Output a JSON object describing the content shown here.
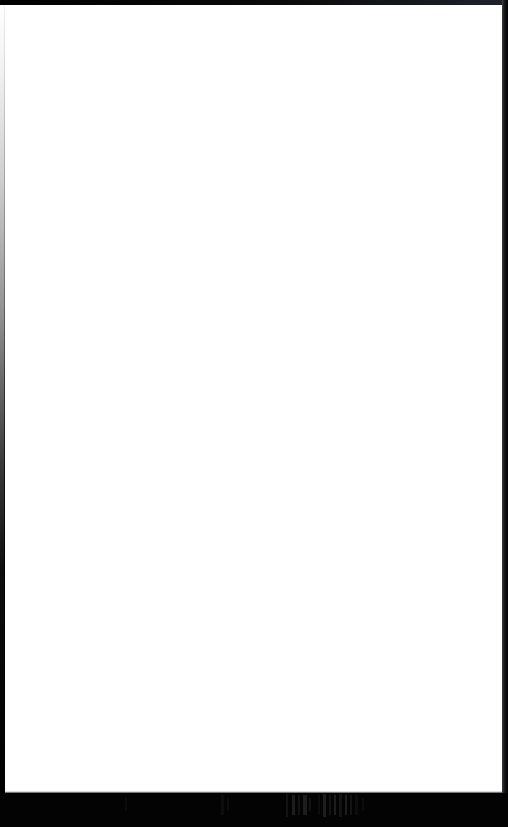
{
  "window": {
    "kind": "document-viewport",
    "width_px": 508,
    "height_px": 827,
    "content_state": "blank",
    "content_text": ""
  },
  "chrome": {
    "top_bar": {
      "name": "top-window-chrome",
      "height_px": 5,
      "color": "#000000",
      "color_right": "#20222a"
    },
    "left_border": {
      "name": "left-window-border",
      "width_px": 5,
      "color_top": "#ffffff",
      "color_bottom": "#000000"
    },
    "right_bar": {
      "name": "right-window-chrome",
      "width_px": 6,
      "color": "#141518",
      "color_edge": "#3c3e45"
    },
    "bottom_bar": {
      "name": "bottom-taskbar",
      "height_px": 34,
      "color": "#030303"
    }
  },
  "page": {
    "name": "document-page",
    "background": "#ffffff",
    "left_px": 5,
    "top_px": 5,
    "width_px": 497,
    "height_px": 788,
    "body_text": ""
  },
  "taskbar": {
    "label": "",
    "legible": false,
    "glyph_color": "#1d1d1d",
    "marks": [
      {
        "x": 125,
        "w": 2,
        "class": "lone short"
      },
      {
        "x": 221,
        "w": 3,
        "class": "dimmer"
      },
      {
        "x": 227,
        "w": 2,
        "class": "dimmer short"
      },
      {
        "x": 286,
        "w": 2,
        "class": "dim tall"
      },
      {
        "x": 292,
        "w": 3,
        "class": ""
      },
      {
        "x": 298,
        "w": 2,
        "class": "dim"
      },
      {
        "x": 303,
        "w": 4,
        "class": ""
      },
      {
        "x": 309,
        "w": 2,
        "class": "dim short"
      },
      {
        "x": 318,
        "w": 2,
        "class": "dimmer"
      },
      {
        "x": 323,
        "w": 3,
        "class": "tall"
      },
      {
        "x": 329,
        "w": 2,
        "class": "dim"
      },
      {
        "x": 334,
        "w": 2,
        "class": ""
      },
      {
        "x": 339,
        "w": 3,
        "class": "dim tall"
      },
      {
        "x": 345,
        "w": 2,
        "class": ""
      },
      {
        "x": 350,
        "w": 2,
        "class": "dim"
      },
      {
        "x": 355,
        "w": 3,
        "class": "dimmer"
      },
      {
        "x": 362,
        "w": 2,
        "class": "dimmer short"
      }
    ]
  }
}
